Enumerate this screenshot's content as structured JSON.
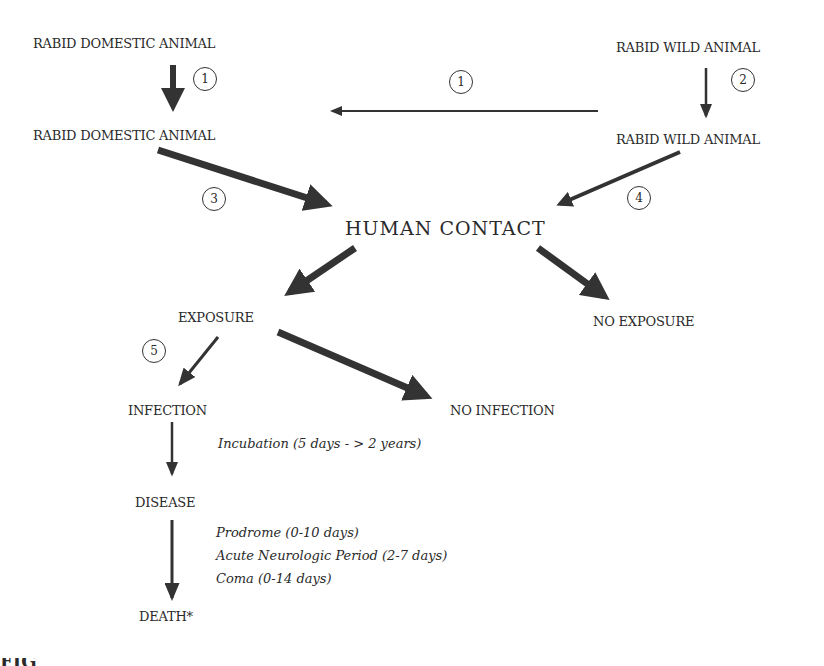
{
  "diagram": {
    "nodes": {
      "domestic_top": "RABID DOMESTIC ANIMAL",
      "domestic_bottom": "RABID DOMESTIC ANIMAL",
      "wild_top": "RABID WILD ANIMAL",
      "wild_bottom": "RABID WILD ANIMAL",
      "human_contact": "HUMAN  CONTACT",
      "exposure": "EXPOSURE",
      "no_exposure": "NO EXPOSURE",
      "infection": "INFECTION",
      "no_infection": "NO INFECTION",
      "disease": "DISEASE",
      "death": "DEATH*"
    },
    "markers": {
      "m1_left": "1",
      "m1_mid": "1",
      "m2": "2",
      "m3": "3",
      "m4": "4",
      "m5": "5"
    },
    "annotations": {
      "incubation": "Incubation (5 days - > 2 years)",
      "prodrome": "Prodrome (0-10 days)",
      "acute": "Acute Neurologic Period (2-7 days)",
      "coma": "Coma (0-14 days)"
    },
    "edges": [
      {
        "from": "RABID DOMESTIC ANIMAL",
        "to": "RABID DOMESTIC ANIMAL",
        "marker": "1"
      },
      {
        "from": "RABID WILD ANIMAL (bottom)",
        "to": "RABID DOMESTIC ANIMAL (bottom)",
        "marker": "1"
      },
      {
        "from": "RABID WILD ANIMAL",
        "to": "RABID WILD ANIMAL",
        "marker": "2"
      },
      {
        "from": "RABID DOMESTIC ANIMAL",
        "to": "HUMAN CONTACT",
        "marker": "3"
      },
      {
        "from": "RABID WILD ANIMAL",
        "to": "HUMAN CONTACT",
        "marker": "4"
      },
      {
        "from": "HUMAN CONTACT",
        "to": "EXPOSURE"
      },
      {
        "from": "HUMAN CONTACT",
        "to": "NO EXPOSURE"
      },
      {
        "from": "EXPOSURE",
        "to": "INFECTION",
        "marker": "5"
      },
      {
        "from": "EXPOSURE",
        "to": "NO INFECTION"
      },
      {
        "from": "INFECTION",
        "to": "DISEASE"
      },
      {
        "from": "DISEASE",
        "to": "DEATH*"
      }
    ],
    "caption_fragment": "FIG"
  }
}
